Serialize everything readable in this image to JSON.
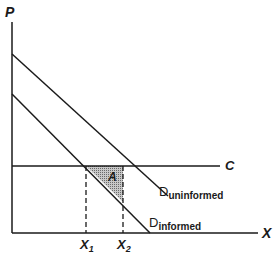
{
  "diagram": {
    "type": "supply-demand",
    "axes": {
      "y_label": "P",
      "x_label": "X"
    },
    "lines": {
      "cost_label": "C",
      "demand_uninformed": {
        "main": "D",
        "sub": "uninformed"
      },
      "demand_informed": {
        "main": "D",
        "sub": "informed"
      }
    },
    "points": {
      "x1": {
        "main": "X",
        "sub": "1"
      },
      "x2": {
        "main": "X",
        "sub": "2"
      }
    },
    "area_label": "A",
    "colors": {
      "ink": "#1a1a1a",
      "shade": "#9a9a9a",
      "background": "#ffffff"
    }
  }
}
